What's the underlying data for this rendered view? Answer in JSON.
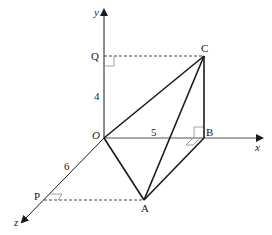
{
  "diagram": {
    "type": "3d-coordinate-geometry",
    "axes": {
      "x": {
        "label": "x"
      },
      "y": {
        "label": "y"
      },
      "z": {
        "label": "z"
      },
      "origin": {
        "label": "O"
      }
    },
    "points": {
      "O": {
        "label": "O"
      },
      "A": {
        "label": "A"
      },
      "B": {
        "label": "B"
      },
      "C": {
        "label": "C"
      },
      "P": {
        "label": "P"
      },
      "Q": {
        "label": "Q"
      }
    },
    "dimensions": {
      "OB": "5",
      "OQ": "4",
      "OP": "6"
    },
    "segments_solid": [
      "OA",
      "OC",
      "AB",
      "AC",
      "BC"
    ],
    "segments_dashed": [
      "QC",
      "PA"
    ],
    "right_angle_marks": [
      "Q",
      "P",
      "B (two)"
    ],
    "colors": {
      "line": "#1a1a1a",
      "right_angle_mark": "#8a8a8a"
    }
  }
}
